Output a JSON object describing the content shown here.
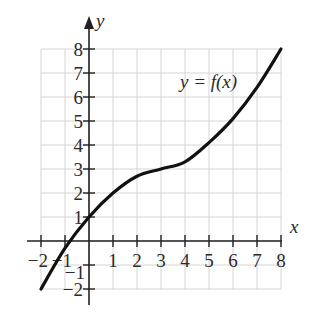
{
  "chart_data": {
    "type": "line",
    "title": "",
    "xlabel": "x",
    "ylabel": "y",
    "xlim": [
      -2,
      8
    ],
    "ylim": [
      -2,
      8
    ],
    "grid": true,
    "x_ticks": [
      -2,
      -1,
      1,
      2,
      3,
      4,
      5,
      6,
      7,
      8
    ],
    "y_ticks": [
      -2,
      -1,
      1,
      2,
      3,
      4,
      5,
      6,
      7,
      8
    ],
    "x_tick_labels": [
      "−2",
      "−1",
      "1",
      "2",
      "3",
      "4",
      "5",
      "6",
      "7",
      "8"
    ],
    "y_tick_labels": [
      "−2",
      "−1",
      "1",
      "2",
      "3",
      "4",
      "5",
      "6",
      "7",
      "8"
    ],
    "series": [
      {
        "name": "y = f(x)",
        "x": [
          -2,
          -1,
          0,
          1,
          2,
          3,
          4,
          5,
          6,
          7,
          8
        ],
        "y": [
          -2,
          -0.3,
          1,
          2,
          2.7,
          3,
          3.3,
          4.1,
          5.1,
          6.4,
          8
        ]
      }
    ],
    "annotations": [
      {
        "text": "y = f(x)",
        "x": 5.6,
        "y": 6.3
      }
    ]
  },
  "labels": {
    "x_axis": "x",
    "y_axis": "y",
    "curve": "y = f(x)"
  }
}
